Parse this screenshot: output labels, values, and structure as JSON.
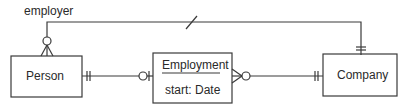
{
  "diagram": {
    "type": "ER crow's-foot",
    "entities": [
      {
        "id": "person",
        "label": "Person"
      },
      {
        "id": "employment",
        "label": "Employment",
        "attributes": [
          "start: Date"
        ]
      },
      {
        "id": "company",
        "label": "Company"
      }
    ],
    "relationships": [
      {
        "from": "person",
        "to": "company",
        "label": "employer",
        "from_end": "zero-or-many",
        "to_end": "one-and-only-one",
        "marker": "slash"
      },
      {
        "from": "person",
        "to": "employment",
        "from_end": "one-and-only-one",
        "to_end": "zero-or-one"
      },
      {
        "from": "employment",
        "to": "company",
        "from_end": "zero-or-many",
        "to_end": "one-and-only-one"
      }
    ]
  },
  "colors": {
    "line": "#3a3a3a",
    "text": "#2a2a2a",
    "background": "#ffffff"
  }
}
